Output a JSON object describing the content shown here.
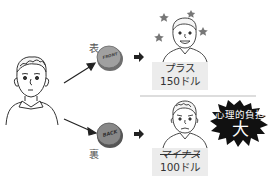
{
  "diagram": {
    "heads_label": "表",
    "tails_label": "裏",
    "coin_front_text": "FRONT",
    "coin_back_text": "BACK",
    "outcome_heads": {
      "line1": "プラス",
      "line2": "150ドル"
    },
    "outcome_tails": {
      "line1": "マイナス",
      "line2": "100ドル"
    },
    "burden_callout": {
      "line1": "心理的負担",
      "line2": "大"
    },
    "colors": {
      "coin": "#8a8a8a",
      "label_bg": "#ececec",
      "burst": "#111111",
      "line": "#222222"
    }
  }
}
